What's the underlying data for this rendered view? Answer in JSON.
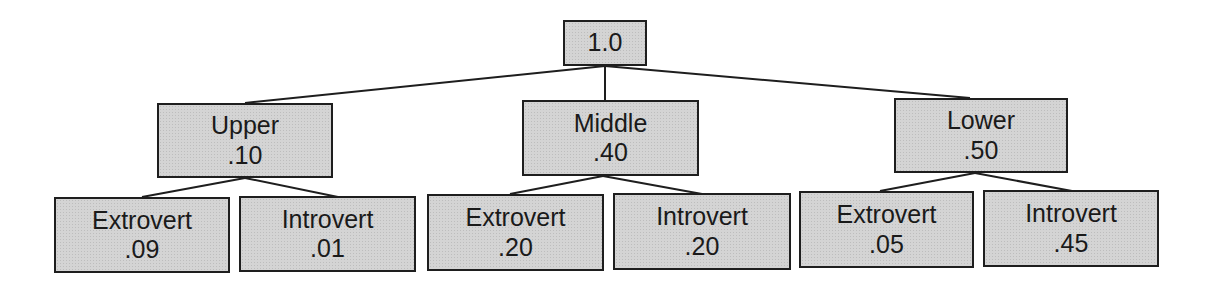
{
  "diagram": {
    "type": "probability-tree",
    "root": {
      "label": "",
      "value": "1.0"
    },
    "level1": [
      {
        "label": "Upper",
        "value": ".10"
      },
      {
        "label": "Middle",
        "value": ".40"
      },
      {
        "label": "Lower",
        "value": ".50"
      }
    ],
    "level2": [
      {
        "label": "Extrovert",
        "value": ".09",
        "parent": "Upper"
      },
      {
        "label": "Introvert",
        "value": ".01",
        "parent": "Upper"
      },
      {
        "label": "Extrovert",
        "value": ".20",
        "parent": "Middle"
      },
      {
        "label": "Introvert",
        "value": ".20",
        "parent": "Middle"
      },
      {
        "label": "Extrovert",
        "value": ".05",
        "parent": "Lower"
      },
      {
        "label": "Introvert",
        "value": ".45",
        "parent": "Lower"
      }
    ],
    "colors": {
      "box_fill": "#d4d4d4",
      "border": "#1e1e1e",
      "text": "#1a1a1a"
    }
  }
}
